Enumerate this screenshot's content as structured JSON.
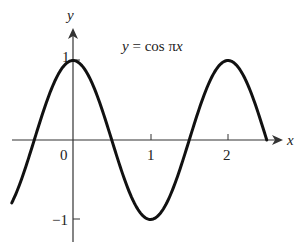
{
  "chart_data": {
    "type": "line",
    "title": "y = cos πx",
    "function": "cos(pi*x)",
    "xlabel": "x",
    "ylabel": "y",
    "xlim": [
      -0.79,
      2.5
    ],
    "ylim": [
      -1,
      1
    ],
    "x_ticks": [
      0,
      1,
      2
    ],
    "x_tick_labels": [
      "0",
      "1",
      "2"
    ],
    "y_ticks": [
      1,
      -1
    ],
    "y_tick_labels": [
      "1",
      "−1"
    ],
    "grid": false,
    "legend": null,
    "series": [
      {
        "name": "y = cos πx",
        "x": [
          -0.79,
          -0.5,
          0,
          0.5,
          1,
          1.5,
          2,
          2.5
        ],
        "values": [
          -0.78,
          0,
          1,
          0,
          -1,
          0,
          1,
          0
        ]
      }
    ],
    "annotations": [
      {
        "text": "y = cos πx",
        "x": 0.55,
        "y": 0.85
      }
    ]
  },
  "labels": {
    "equation_lhs": "y",
    "equation_eq": " = cos π",
    "equation_var": "x",
    "x_axis": "x",
    "y_axis": "y",
    "tick_x0": "0",
    "tick_x1": "1",
    "tick_x2": "2",
    "tick_y1": "1",
    "tick_yneg1": "−1"
  },
  "colors": {
    "curve": "#111111",
    "axes": "#333333",
    "background": "#ffffff"
  }
}
